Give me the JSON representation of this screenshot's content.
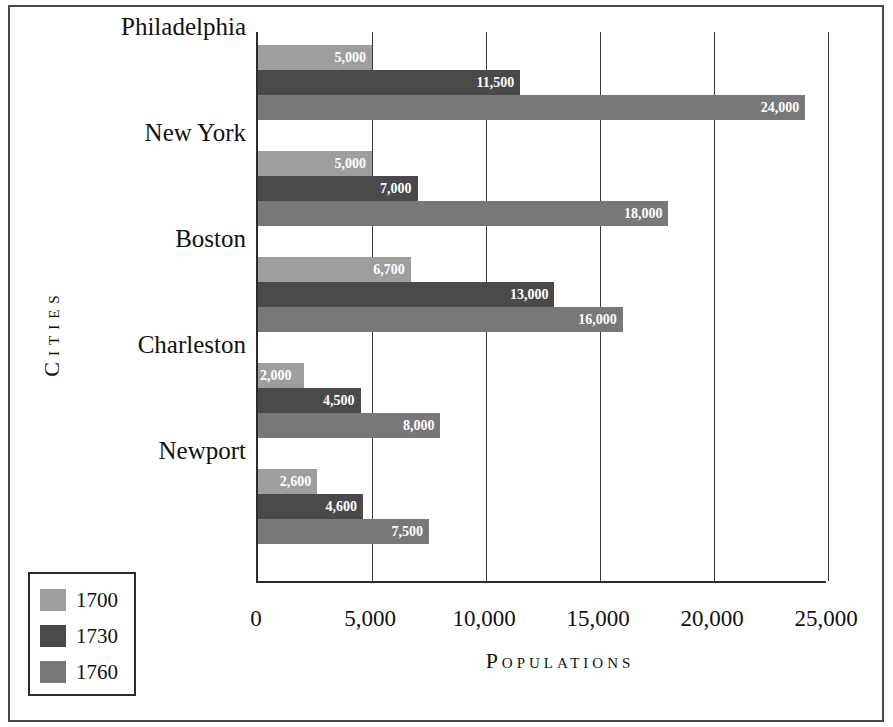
{
  "chart_data": {
    "type": "bar",
    "orientation": "horizontal",
    "title": "",
    "xlabel": "Populations",
    "ylabel": "Cities",
    "categories": [
      "Philadelphia",
      "New York",
      "Boston",
      "Charleston",
      "Newport"
    ],
    "series": [
      {
        "name": "1700",
        "color": "#9e9e9e",
        "values": [
          5000,
          5000,
          6700,
          2000,
          2600
        ],
        "labels": [
          "5,000",
          "5,000",
          "6,700",
          "2,000",
          "2,600"
        ]
      },
      {
        "name": "1730",
        "color": "#4a4a4a",
        "values": [
          11500,
          7000,
          13000,
          4500,
          4600
        ],
        "labels": [
          "11,500",
          "7,000",
          "13,000",
          "4,500",
          "4,600"
        ]
      },
      {
        "name": "1760",
        "color": "#787878",
        "values": [
          24000,
          18000,
          16000,
          8000,
          7500
        ],
        "labels": [
          "24,000",
          "18,000",
          "16,000",
          "8,000",
          "7,500"
        ]
      }
    ],
    "xlim": [
      0,
      25000
    ],
    "xticks": [
      0,
      5000,
      10000,
      15000,
      20000,
      25000
    ],
    "xtick_labels": [
      "0",
      "5,000",
      "10,000",
      "15,000",
      "20,000",
      "25,000"
    ],
    "grid": true,
    "grid_axis": "x",
    "legend_position": "bottom-left",
    "data_labels": true,
    "data_label_color": "#ffffff"
  },
  "axes": {
    "x_title": "Populations",
    "y_title": "Cities"
  },
  "legend": {
    "items": [
      {
        "label": "1700",
        "color": "#9e9e9e"
      },
      {
        "label": "1730",
        "color": "#4a4a4a"
      },
      {
        "label": "1760",
        "color": "#787878"
      }
    ]
  }
}
